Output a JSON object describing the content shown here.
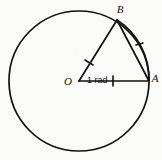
{
  "figure": {
    "background_color": "#fbfbfa",
    "line_color": "#101010",
    "labels": {
      "center": "O",
      "point_a": "A",
      "point_b": "B",
      "angle": "1 rad"
    },
    "geometry": {
      "center_x": 79,
      "center_y": 81,
      "radius": 70,
      "point_a_x": 149,
      "point_a_y": 81,
      "point_b_x": 117,
      "point_b_y": 20,
      "angle_radians": 1,
      "radius_tick_oa_x": 113,
      "radius_tick_oa_y": 81,
      "radius_tick_ob_x": 89,
      "radius_tick_ob_y": 63,
      "arc_tick_x": 139,
      "arc_tick_y": 45
    },
    "marks": {
      "oa_tick_count": 1,
      "ob_tick_count": 1,
      "arc_ab_tick_count": 1
    }
  }
}
